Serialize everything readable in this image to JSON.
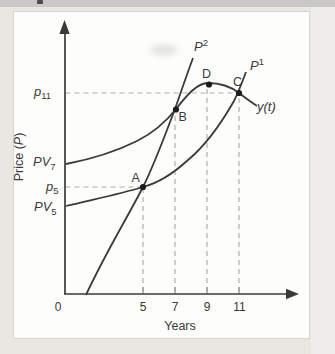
{
  "chart_data": {
    "type": "line",
    "title": "",
    "xlabel": "Years",
    "ylabel": "Price (P)",
    "x_ticks": [
      0,
      5,
      7,
      9,
      11
    ],
    "xlim": [
      0,
      14
    ],
    "ylim": [
      0,
      100
    ],
    "grid": false,
    "value_note": "y-axis has no numeric scale in the figure; values are relative price units read from symbolic levels",
    "y_axis_levels": [
      {
        "label": "p11",
        "value": 76
      },
      {
        "label": "PV7",
        "value": 50
      },
      {
        "label": "p5",
        "value": 40
      },
      {
        "label": "PV5",
        "value": 33
      }
    ],
    "series": [
      {
        "name": "P2",
        "x": [
          1.3,
          5,
          7,
          8.1
        ],
        "y": [
          0,
          40,
          70,
          89
        ]
      },
      {
        "name": "P1",
        "x": [
          0,
          5,
          7.7,
          10.6,
          11,
          11.4
        ],
        "y": [
          33,
          40,
          51,
          73,
          76,
          84
        ]
      },
      {
        "name": "y(t)",
        "x": [
          0,
          4.5,
          7,
          9,
          11,
          12.1
        ],
        "y": [
          50,
          58,
          70,
          80,
          76,
          71
        ]
      }
    ],
    "annotated_points": [
      {
        "label": "A",
        "x": 5,
        "y": 40,
        "meaning": "P2 crosses P1 at p5"
      },
      {
        "label": "B",
        "x": 7,
        "y": 70,
        "meaning": "P2 crosses y(t)"
      },
      {
        "label": "C",
        "x": 11,
        "y": 76,
        "meaning": "P1 crosses y(t) at p11"
      },
      {
        "label": "D",
        "x": 9,
        "y": 80,
        "meaning": "maximum of y(t)"
      }
    ],
    "dashed_guides": {
      "horizontal": [
        {
          "from_label": "p11",
          "to_x": 11
        },
        {
          "from_label": "p5",
          "to_x": 5
        }
      ],
      "vertical_x": [
        5,
        7,
        9,
        11
      ]
    },
    "legend_position": "none"
  },
  "figure": {
    "viewBox": "0 0 335 354",
    "colors": {
      "ink": "#3a3a3a",
      "dash": "#b0b0b0",
      "tick": "#8f8f8f",
      "dot": "#1c1c1c",
      "card_bg": "#fdfdfb",
      "page_bg": "#e9e7e2",
      "top_strip": "#c9c8c6",
      "card_border": "#d7d5cf"
    },
    "shapes": [
      {
        "name": "dashed-line-p11",
        "kind": "path",
        "d": "M 65.5 93 L 239 93",
        "stroke": "dash",
        "w": 1.2,
        "dash": "5,4"
      },
      {
        "name": "dashed-line-p5",
        "kind": "path",
        "d": "M 65.5 187 L 143 187",
        "stroke": "dash",
        "w": 1.2,
        "dash": "5,4"
      },
      {
        "name": "dashed-line-year5",
        "kind": "path",
        "d": "M 143 292 L 143 188",
        "stroke": "dash",
        "w": 1.2,
        "dash": "5,4"
      },
      {
        "name": "dashed-line-year7",
        "kind": "path",
        "d": "M 175 292 L 175 110",
        "stroke": "dash",
        "w": 1.2,
        "dash": "5,4"
      },
      {
        "name": "dashed-line-year9",
        "kind": "path",
        "d": "M 207 292 L 207 85",
        "stroke": "dash",
        "w": 1.2,
        "dash": "5,4"
      },
      {
        "name": "dashed-line-year11",
        "kind": "path",
        "d": "M 239 292 L 239 94",
        "stroke": "dash",
        "w": 1.2,
        "dash": "5,4"
      },
      {
        "name": "x-axis-ticks",
        "kind": "path",
        "d": "M 143 294 L 143 287 M 175 294 L 175 287 M 207 294 L 207 287 M 239 294 L 239 287",
        "stroke": "tick",
        "w": 1.2
      },
      {
        "name": "curve-p2",
        "kind": "path",
        "d": "M 86 295 C 105 254 126 220 143 187 C 155 163 165 135 175 109 C 181 92 187 74 193 58",
        "stroke": "ink",
        "w": 1.8
      },
      {
        "name": "curve-p1",
        "kind": "path",
        "d": "M 66 206 C 95 199 120 194 143 187 C 162 182 176 171 188 160 C 205 146 222 122 234 101 C 239 91 243 80 246 72",
        "stroke": "ink",
        "w": 1.8
      },
      {
        "name": "curve-yt",
        "kind": "path",
        "d": "M 66 164 C 92 159 115 152 137 141 C 151 134 165 123 176 109 C 187 95 197 83 208 83 C 219 83 230 86 239 93 C 246 98.5 251 102 257 106",
        "stroke": "ink",
        "w": 1.8
      },
      {
        "name": "y-axis",
        "kind": "path",
        "d": "M 65 294 L 65 31",
        "stroke": "ink",
        "w": 1.7
      },
      {
        "name": "x-axis",
        "kind": "path",
        "d": "M 64 294 L 290 294",
        "stroke": "ink",
        "w": 1.7
      },
      {
        "name": "y-axis-arrowhead",
        "kind": "polygon",
        "points": "64.5,20 59.3,34 69.7,34",
        "fill": "ink"
      },
      {
        "name": "x-axis-arrowhead",
        "kind": "polygon",
        "points": "299,294 286,288.8 286,299.2",
        "fill": "ink"
      },
      {
        "name": "point-a",
        "kind": "circle",
        "cx": 143,
        "cy": 187,
        "r": 3.1
      },
      {
        "name": "point-b",
        "kind": "circle",
        "cx": 176,
        "cy": 109.5,
        "r": 3.1
      },
      {
        "name": "point-c",
        "kind": "circle",
        "cx": 239,
        "cy": 93,
        "r": 3.1
      },
      {
        "name": "point-d",
        "kind": "circle",
        "cx": 209,
        "cy": 84.5,
        "r": 3.1
      }
    ],
    "labels": [
      {
        "name": "label-p11",
        "x": 34,
        "y": 95.5,
        "size": 13,
        "parts": [
          {
            "t": "p",
            "i": true
          },
          {
            "t": "11",
            "s": "sub"
          }
        ]
      },
      {
        "name": "label-pv7",
        "x": 33,
        "y": 166,
        "size": 13,
        "parts": [
          {
            "t": "PV",
            "i": true
          },
          {
            "t": "7",
            "s": "sub"
          }
        ]
      },
      {
        "name": "label-p5",
        "x": 46,
        "y": 190.5,
        "size": 13,
        "parts": [
          {
            "t": "p",
            "i": true
          },
          {
            "t": "5",
            "s": "sub"
          }
        ]
      },
      {
        "name": "label-pv5",
        "x": 34,
        "y": 211,
        "size": 13,
        "parts": [
          {
            "t": "PV",
            "i": true
          },
          {
            "t": "5",
            "s": "sub"
          }
        ]
      },
      {
        "name": "label-curve-p2",
        "x": 194,
        "y": 51,
        "size": 13,
        "parts": [
          {
            "t": "P",
            "i": true
          },
          {
            "t": "2",
            "s": "sup"
          }
        ]
      },
      {
        "name": "label-curve-p1",
        "x": 250,
        "y": 70,
        "size": 13,
        "parts": [
          {
            "t": "P",
            "i": true
          },
          {
            "t": "1",
            "s": "sup"
          }
        ]
      },
      {
        "name": "label-curve-yt",
        "x": 257,
        "y": 111,
        "size": 13,
        "parts": [
          {
            "t": "y(t)",
            "i": true
          }
        ]
      },
      {
        "name": "label-point-a",
        "x": 131.5,
        "y": 182,
        "size": 12.5,
        "parts": [
          {
            "t": "A"
          }
        ]
      },
      {
        "name": "label-point-b",
        "x": 178.5,
        "y": 121,
        "size": 12.5,
        "parts": [
          {
            "t": "B"
          }
        ]
      },
      {
        "name": "label-point-c",
        "x": 233,
        "y": 85.5,
        "size": 12.5,
        "parts": [
          {
            "t": "C"
          }
        ]
      },
      {
        "name": "label-point-d",
        "x": 202,
        "y": 78,
        "size": 12.5,
        "parts": [
          {
            "t": "D"
          }
        ]
      },
      {
        "name": "tick-label-0",
        "x": 58,
        "y": 311,
        "size": 12,
        "anchor": "middle",
        "parts": [
          {
            "t": "0"
          }
        ]
      },
      {
        "name": "tick-label-5",
        "x": 143,
        "y": 311,
        "size": 12,
        "anchor": "middle",
        "parts": [
          {
            "t": "5"
          }
        ]
      },
      {
        "name": "tick-label-7",
        "x": 175,
        "y": 311,
        "size": 12,
        "anchor": "middle",
        "parts": [
          {
            "t": "7"
          }
        ]
      },
      {
        "name": "tick-label-9",
        "x": 207,
        "y": 311,
        "size": 12,
        "anchor": "middle",
        "parts": [
          {
            "t": "9"
          }
        ]
      },
      {
        "name": "tick-label-11",
        "x": 239.5,
        "y": 311,
        "size": 12,
        "anchor": "middle",
        "parts": [
          {
            "t": "11"
          }
        ]
      },
      {
        "name": "x-axis-title",
        "x": 180,
        "y": 330,
        "size": 12.5,
        "anchor": "middle",
        "parts": [
          {
            "t": "Years"
          }
        ]
      },
      {
        "name": "y-axis-title",
        "x": 23,
        "y": 157,
        "size": 12.5,
        "anchor": "middle",
        "rotate": -90,
        "parts": [
          {
            "t": "Price ("
          },
          {
            "t": "P",
            "i": true
          },
          {
            "t": ")"
          }
        ]
      }
    ]
  }
}
